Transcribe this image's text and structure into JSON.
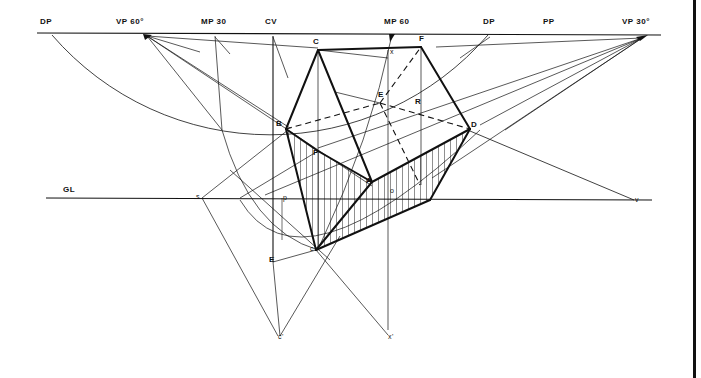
{
  "diagram": {
    "type": "perspective-construction",
    "colors": {
      "ink": "#111111",
      "background": "#ffffff",
      "hatch": "#222222"
    },
    "labels": [
      {
        "id": "dp-left",
        "text": "DP",
        "x": 40,
        "y": 25
      },
      {
        "id": "vp60",
        "text": "VP 60°",
        "x": 116,
        "y": 25
      },
      {
        "id": "mp30",
        "text": "MP 30",
        "x": 201,
        "y": 25
      },
      {
        "id": "cv",
        "text": "CV",
        "x": 265,
        "y": 25
      },
      {
        "id": "mp60",
        "text": "MP 60",
        "x": 384,
        "y": 25
      },
      {
        "id": "dp-right",
        "text": "DP",
        "x": 483,
        "y": 25
      },
      {
        "id": "pp",
        "text": "PP",
        "x": 543,
        "y": 25
      },
      {
        "id": "vp30",
        "text": "VP 30°",
        "x": 622,
        "y": 25
      },
      {
        "id": "C",
        "text": "C",
        "x": 313,
        "y": 45
      },
      {
        "id": "F",
        "text": "F",
        "x": 419,
        "y": 42
      },
      {
        "id": "x",
        "text": "x",
        "x": 390,
        "y": 55,
        "small": true
      },
      {
        "id": "E-upper",
        "text": "E",
        "x": 378,
        "y": 98
      },
      {
        "id": "R",
        "text": "R",
        "x": 415,
        "y": 105
      },
      {
        "id": "B",
        "text": "B",
        "x": 276,
        "y": 127
      },
      {
        "id": "D",
        "text": "D",
        "x": 471,
        "y": 128
      },
      {
        "id": "P-upper",
        "text": "P",
        "x": 313,
        "y": 156
      },
      {
        "id": "A",
        "text": "A",
        "x": 366,
        "y": 184
      },
      {
        "id": "o",
        "text": "o",
        "x": 390,
        "y": 194,
        "small": true
      },
      {
        "id": "GL",
        "text": "GL",
        "x": 63,
        "y": 193
      },
      {
        "id": "s",
        "text": "s",
        "x": 196,
        "y": 200,
        "small": true
      },
      {
        "id": "p-lower",
        "text": "p",
        "x": 283,
        "y": 201,
        "small": true
      },
      {
        "id": "v",
        "text": "v",
        "x": 635,
        "y": 203,
        "small": true
      },
      {
        "id": "c-lower",
        "text": "c",
        "x": 310,
        "y": 252,
        "small": true
      },
      {
        "id": "E-lower",
        "text": "E",
        "x": 269,
        "y": 263
      },
      {
        "id": "c-prime",
        "text": "c'",
        "x": 278,
        "y": 340,
        "small": true
      },
      {
        "id": "x-prime",
        "text": "x'",
        "x": 388,
        "y": 340,
        "small": true
      }
    ],
    "lines": [
      {
        "name": "picture-plane-line",
        "x1": 37,
        "y1": 33,
        "x2": 661,
        "y2": 35,
        "w": 1.2
      },
      {
        "name": "ground-line",
        "x1": 46,
        "y1": 198,
        "x2": 652,
        "y2": 200,
        "w": 1.1
      },
      {
        "name": "cv-vertical",
        "x1": 273,
        "y1": 36,
        "x2": 273,
        "y2": 262,
        "w": 1.1
      },
      {
        "name": "mp30-vertical",
        "x1": 215,
        "y1": 36,
        "x2": 222,
        "y2": 130,
        "w": 0.7
      },
      {
        "name": "vp60-ray-1",
        "x1": 147,
        "y1": 36,
        "x2": 200,
        "y2": 52,
        "w": 0.7
      },
      {
        "name": "vp60-ray-2",
        "x1": 147,
        "y1": 36,
        "x2": 290,
        "y2": 128,
        "w": 0.7
      },
      {
        "name": "vp60-ray-3",
        "x1": 147,
        "y1": 36,
        "x2": 318,
        "y2": 48,
        "w": 0.7
      },
      {
        "name": "vp60-ray-4",
        "x1": 147,
        "y1": 36,
        "x2": 372,
        "y2": 186,
        "w": 0.7
      },
      {
        "name": "vp60-ray-5",
        "x1": 147,
        "y1": 36,
        "x2": 222,
        "y2": 130,
        "w": 0.7
      },
      {
        "name": "mp30-ray",
        "x1": 215,
        "y1": 37,
        "x2": 230,
        "y2": 54,
        "w": 0.7
      },
      {
        "name": "cv-ray",
        "x1": 273,
        "y1": 37,
        "x2": 288,
        "y2": 78,
        "w": 0.7
      },
      {
        "name": "vp30-ray-1",
        "x1": 642,
        "y1": 38,
        "x2": 436,
        "y2": 47,
        "w": 0.7
      },
      {
        "name": "vp30-ray-2",
        "x1": 642,
        "y1": 38,
        "x2": 318,
        "y2": 148,
        "w": 0.7
      },
      {
        "name": "vp30-ray-3",
        "x1": 642,
        "y1": 38,
        "x2": 480,
        "y2": 125,
        "w": 0.7
      },
      {
        "name": "vp30-ray-4",
        "x1": 642,
        "y1": 38,
        "x2": 505,
        "y2": 130,
        "w": 0.7
      },
      {
        "name": "vp30-ray-5",
        "x1": 642,
        "y1": 38,
        "x2": 432,
        "y2": 178,
        "w": 0.7
      },
      {
        "name": "vp30-ray-6",
        "x1": 642,
        "y1": 38,
        "x2": 265,
        "y2": 195,
        "w": 0.7
      },
      {
        "name": "dp-right-ray",
        "x1": 490,
        "y1": 37,
        "x2": 460,
        "y2": 58,
        "w": 0.7
      },
      {
        "name": "x-horizontal",
        "x1": 318,
        "y1": 50,
        "x2": 388,
        "y2": 58,
        "w": 0.7
      },
      {
        "name": "x-vertical",
        "x1": 388,
        "y1": 50,
        "x2": 388,
        "y2": 330,
        "w": 0.7
      },
      {
        "name": "F-vertical",
        "x1": 421,
        "y1": 47,
        "x2": 421,
        "y2": 185,
        "w": 0.7
      },
      {
        "name": "C-vertical",
        "x1": 318,
        "y1": 50,
        "x2": 318,
        "y2": 250,
        "w": 0.7
      },
      {
        "name": "E-line",
        "x1": 335,
        "y1": 92,
        "x2": 380,
        "y2": 103,
        "w": 0.7
      },
      {
        "name": "D-to-v",
        "x1": 470,
        "y1": 131,
        "x2": 634,
        "y2": 200,
        "w": 0.8
      },
      {
        "name": "s-to-B",
        "x1": 202,
        "y1": 198,
        "x2": 288,
        "y2": 130,
        "w": 0.7
      },
      {
        "name": "s-to-cprime",
        "x1": 202,
        "y1": 198,
        "x2": 278,
        "y2": 336,
        "w": 0.7
      },
      {
        "name": "s-line",
        "x1": 240,
        "y1": 198,
        "x2": 318,
        "y2": 151,
        "w": 0.7
      },
      {
        "name": "E-to-cprime",
        "x1": 273,
        "y1": 262,
        "x2": 280,
        "y2": 336,
        "w": 0.7
      },
      {
        "name": "c-to-xprime",
        "x1": 316,
        "y1": 250,
        "x2": 388,
        "y2": 335,
        "w": 0.7
      },
      {
        "name": "cprime-up",
        "x1": 280,
        "y1": 336,
        "x2": 340,
        "y2": 236,
        "w": 0.7
      },
      {
        "name": "E-to-c",
        "x1": 273,
        "y1": 262,
        "x2": 316,
        "y2": 250,
        "w": 0.7
      },
      {
        "name": "p-vertical",
        "x1": 282,
        "y1": 198,
        "x2": 282,
        "y2": 240,
        "w": 0.6
      },
      {
        "name": "c-diag",
        "x1": 230,
        "y1": 170,
        "x2": 330,
        "y2": 260,
        "w": 0.7
      }
    ],
    "bold_lines": [
      {
        "name": "edge-C-F",
        "x1": 318,
        "y1": 50,
        "x2": 421,
        "y2": 47
      },
      {
        "name": "edge-B-C",
        "x1": 286,
        "y1": 129,
        "x2": 318,
        "y2": 50
      },
      {
        "name": "edge-C-A",
        "x1": 318,
        "y1": 50,
        "x2": 372,
        "y2": 182
      },
      {
        "name": "edge-F-D",
        "x1": 421,
        "y1": 47,
        "x2": 470,
        "y2": 129
      },
      {
        "name": "edge-B-P",
        "x1": 286,
        "y1": 129,
        "x2": 318,
        "y2": 151
      },
      {
        "name": "edge-P-A",
        "x1": 318,
        "y1": 151,
        "x2": 372,
        "y2": 182
      },
      {
        "name": "edge-A-D",
        "x1": 372,
        "y1": 182,
        "x2": 470,
        "y2": 129
      },
      {
        "name": "edge-B-c",
        "x1": 286,
        "y1": 129,
        "x2": 316,
        "y2": 250
      },
      {
        "name": "edge-c-A",
        "x1": 316,
        "y1": 250,
        "x2": 372,
        "y2": 182
      },
      {
        "name": "edge-c-lowD",
        "x1": 316,
        "y1": 250,
        "x2": 430,
        "y2": 200
      },
      {
        "name": "edge-lowD-D",
        "x1": 430,
        "y1": 200,
        "x2": 470,
        "y2": 129
      }
    ],
    "dashed_lines": [
      {
        "name": "dash-B-E",
        "x1": 286,
        "y1": 129,
        "x2": 380,
        "y2": 103
      },
      {
        "name": "dash-E-F",
        "x1": 380,
        "y1": 103,
        "x2": 421,
        "y2": 47
      },
      {
        "name": "dash-E-D",
        "x1": 380,
        "y1": 103,
        "x2": 470,
        "y2": 129
      },
      {
        "name": "dash-E-down",
        "x1": 380,
        "y1": 103,
        "x2": 420,
        "y2": 185
      }
    ],
    "arcs": [
      {
        "name": "dp-circle-arc",
        "d": "M 52 35 A 288 288 0 0 0 488 35",
        "w": 0.8
      },
      {
        "name": "mp30-arc",
        "d": "M 222 130 Q 250 230 318 250",
        "w": 0.7
      },
      {
        "name": "mp60-arc",
        "d": "M 392 35 Q 370 140 320 245",
        "w": 0.7
      },
      {
        "name": "inner-arc",
        "d": "M 240 200 Q 300 300 480 130",
        "w": 0.7
      }
    ],
    "hatch_regions": [
      {
        "name": "hatch-left-face",
        "points": "286,129 318,151 372,182 316,250"
      },
      {
        "name": "hatch-right-face",
        "points": "372,182 470,129 430,200 316,250"
      }
    ]
  }
}
